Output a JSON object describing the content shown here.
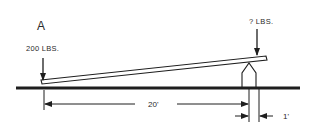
{
  "diagram": {
    "point_label": "A",
    "left_load": "200 LBS.",
    "right_load": "? LBS.",
    "long_distance": "20'",
    "short_distance": "1'",
    "colors": {
      "ink": "#1e1e1e",
      "background": "#ffffff"
    }
  }
}
